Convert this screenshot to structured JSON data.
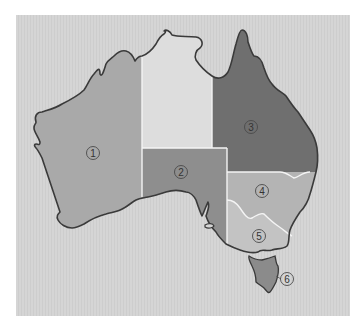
{
  "map": {
    "subject": "Australia states and territories",
    "background_color": "#d5d5d5",
    "coast_color": "#3a3a3a",
    "border_color": "#f4f4f4",
    "regions": [
      {
        "id": "1",
        "label": "1",
        "glyph": "①",
        "color": "#a9a9a9",
        "cx": 93,
        "cy": 153
      },
      {
        "id": "2",
        "label": "2",
        "glyph": "②",
        "color": "#8e8e8e",
        "cx": 181,
        "cy": 172
      },
      {
        "id": "3",
        "label": "3",
        "glyph": "③",
        "color": "#6f6f6f",
        "cx": 251,
        "cy": 127
      },
      {
        "id": "4",
        "label": "4",
        "glyph": "④",
        "color": "#b4b4b4",
        "cx": 262,
        "cy": 191
      },
      {
        "id": "5",
        "label": "5",
        "glyph": "⑤",
        "color": "#c3c3c3",
        "cx": 259,
        "cy": 236
      },
      {
        "id": "6",
        "label": "6",
        "glyph": "⑥",
        "color": "#8b8b8b",
        "cx": 287,
        "cy": 279
      }
    ],
    "unlabeled_regions": [
      {
        "id": "north",
        "color": "#dddddd"
      }
    ]
  }
}
